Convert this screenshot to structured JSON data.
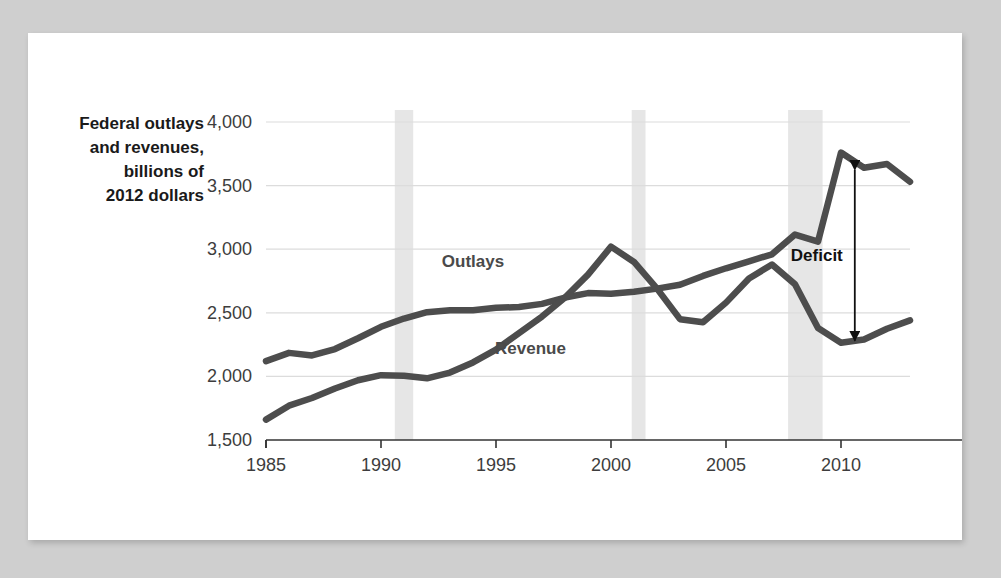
{
  "chart_data": {
    "type": "line",
    "title": "",
    "ylabel_lines": [
      "Federal outlays",
      "and revenues,",
      "billions of",
      "2012 dollars"
    ],
    "xlabel": "",
    "xlim": [
      1985,
      2013
    ],
    "ylim": [
      1500,
      4000
    ],
    "ytick_labels": [
      "1,500",
      "2,000",
      "2,500",
      "3,000",
      "3,500",
      "4,000"
    ],
    "ytick_values": [
      1500,
      2000,
      2500,
      3000,
      3500,
      4000
    ],
    "xtick_labels": [
      "1985",
      "1990",
      "1995",
      "2000",
      "2005",
      "2010"
    ],
    "xtick_values": [
      1985,
      1990,
      1995,
      2000,
      2005,
      2010
    ],
    "grid": true,
    "legend_position": "inline-labels",
    "x": [
      1985,
      1986,
      1987,
      1988,
      1989,
      1990,
      1991,
      1992,
      1993,
      1994,
      1995,
      1996,
      1997,
      1998,
      1999,
      2000,
      2001,
      2002,
      2003,
      2004,
      2005,
      2006,
      2007,
      2008,
      2009,
      2010,
      2011,
      2012,
      2013
    ],
    "series": [
      {
        "name": "Outlays",
        "color": "#4d4d4d",
        "values": [
          2120,
          2185,
          2165,
          2215,
          2300,
          2390,
          2455,
          2505,
          2520,
          2520,
          2540,
          2545,
          2570,
          2620,
          2655,
          2650,
          2665,
          2690,
          2720,
          2790,
          2850,
          2905,
          2960,
          3115,
          3060,
          3760,
          3640,
          3670,
          3530
        ]
      },
      {
        "name": "Revenue",
        "color": "#4d4d4d",
        "values": [
          1660,
          1770,
          1830,
          1905,
          1970,
          2010,
          2005,
          1985,
          2030,
          2110,
          2210,
          2340,
          2470,
          2620,
          2800,
          3020,
          2900,
          2690,
          2450,
          2425,
          2580,
          2770,
          2880,
          2725,
          2380,
          2265,
          2290,
          2375,
          2440
        ]
      }
    ],
    "shaded_bands": [
      {
        "name": "recession-1990-1991",
        "start": 1990.6,
        "end": 1991.4
      },
      {
        "name": "recession-2001",
        "start": 2000.9,
        "end": 2001.5
      },
      {
        "name": "recession-2008-2009",
        "start": 2007.7,
        "end": 2009.2
      }
    ],
    "band_color": "#e6e6e6",
    "annotations": [
      {
        "name": "deficit-arrow",
        "label": "Deficit",
        "x": 2010.6,
        "y_top": 3625,
        "y_bottom": 2280,
        "arrow": "double-headed-vertical"
      }
    ],
    "series_labels": [
      {
        "name": "outlays-label",
        "text": "Outlays",
        "x": 1994.0,
        "y": 2860
      },
      {
        "name": "revenue-label",
        "text": "Revenue",
        "x": 1996.5,
        "y": 2175
      }
    ]
  }
}
